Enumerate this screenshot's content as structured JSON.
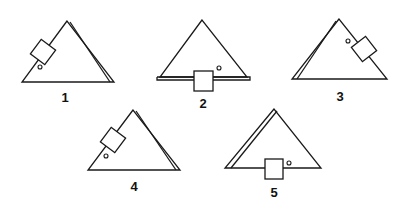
{
  "figure": {
    "panels": [
      {
        "label": "1",
        "description": "Triangle with double line on right side; square block on left slope, small circle inside near left slope"
      },
      {
        "label": "2",
        "description": "Triangle with double line on base; square block on base, small circle to the right above base"
      },
      {
        "label": "3",
        "description": "Triangle with double line on left side; square block on right slope, small circle inside near right slope"
      },
      {
        "label": "4",
        "description": "Triangle with double line on right side; square block on left slope, small circle inside below block"
      },
      {
        "label": "5",
        "description": "Triangle with double line on left side; square block on base, small circle to the right"
      }
    ],
    "colors": {
      "ink": "#1a1a1a",
      "background": "#ffffff"
    }
  }
}
